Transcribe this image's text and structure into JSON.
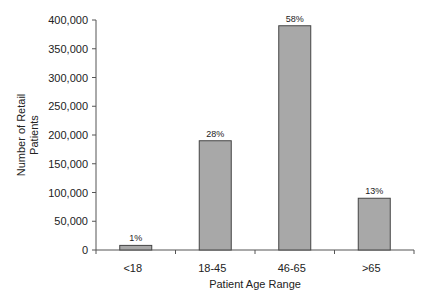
{
  "chart_data": {
    "type": "bar",
    "title": "",
    "xlabel": "Patient Age Range",
    "ylabel": "Number of Retail Patients",
    "ylabel_lines": [
      "Number of Retail",
      "Patients"
    ],
    "categories": [
      "<18",
      "18-45",
      "46-65",
      ">65"
    ],
    "values": [
      8000,
      190000,
      390000,
      90000
    ],
    "data_labels": [
      "1%",
      "28%",
      "58%",
      "13%"
    ],
    "ylim": [
      0,
      400000
    ],
    "yticks": [
      "0",
      "50,000",
      "100,000",
      "150,000",
      "200,000",
      "250,000",
      "300,000",
      "350,000",
      "400,000"
    ],
    "grid": false,
    "legend": null,
    "bar_color": "#a8a8a8"
  }
}
